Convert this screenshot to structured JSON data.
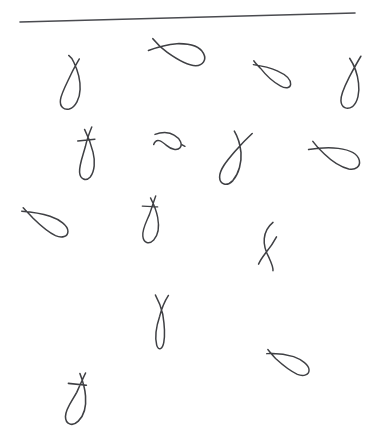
{
  "canvas": {
    "width": 375,
    "height": 428,
    "background_color": "#ffffff",
    "ink_color": "#3f4044",
    "title": "Handwritten loop strokes"
  },
  "rule": {
    "name": "horizontal-rule",
    "x1": 20,
    "y1": 22,
    "x2": 355,
    "y2": 13,
    "stroke_width": 1.6,
    "color": "#4a4b50"
  },
  "strokes": [
    {
      "id": 1,
      "label": "vertical-loop-hooked-top",
      "center_x": 72,
      "center_y": 83,
      "rotation": 8,
      "scale": 1.0,
      "stroke_width": 1.5,
      "variant": "loop-tall",
      "path": "M 14 2 C 12 7 10 12 8 18 C 5 28 1 38 1 45 C 1 52 6 55 11 53 C 17 50 20 41 19 32 C 18 22 13 12 9 6 C 7 3 5 1 3 0"
    },
    {
      "id": 2,
      "label": "diagonal-loop-crossed-tail",
      "center_x": 176,
      "center_y": 52,
      "rotation": -28,
      "scale": 1.05,
      "stroke_width": 1.5,
      "variant": "loop-slanted",
      "path": "M 0 8 C 8 9 18 11 27 15 C 37 20 45 27 45 35 C 45 42 39 45 33 42 C 26 38 20 28 15 18 C 12 12 10 5 9 0"
    },
    {
      "id": 3,
      "label": "flat-loop-crossed-tail",
      "center_x": 272,
      "center_y": 74,
      "rotation": -8,
      "scale": 0.95,
      "stroke_width": 1.5,
      "variant": "loop-flat",
      "path": "M 0 4 C 7 6 16 9 24 14 C 32 19 37 25 36 30 C 35 34 30 34 25 30 C 18 25 11 16 7 9 C 4 5 2 2 1 0"
    },
    {
      "id": 4,
      "label": "vertical-loop-rising-tail",
      "center_x": 351,
      "center_y": 82,
      "rotation": 5,
      "scale": 1.0,
      "stroke_width": 1.5,
      "variant": "loop-tall",
      "path": "M 17 0 C 14 6 11 13 8 20 C 4 30 0 39 1 46 C 2 53 8 55 13 51 C 18 46 19 36 17 27 C 15 17 10 8 6 3"
    },
    {
      "id": 5,
      "label": "vertical-loop-cross-bar",
      "center_x": 86,
      "center_y": 153,
      "rotation": 4,
      "scale": 1.0,
      "stroke_width": 1.5,
      "variant": "loop-tall-crossed",
      "path": "M 13 1 C 11 7 9 14 8 21 C 6 31 3 40 4 47 C 5 54 11 56 15 51 C 19 45 19 35 16 26 C 13 17 9 9 6 4 M 0 16 L 17 13"
    },
    {
      "id": 6,
      "label": "horizontal-flat-loop",
      "center_x": 169,
      "center_y": 141,
      "rotation": -4,
      "scale": 1.0,
      "stroke_width": 1.5,
      "variant": "loop-lazy",
      "path": "M 2 2 C 8 0 16 0 21 4 C 27 8 29 14 26 17 C 23 20 17 18 13 14 C 8 9 3 5 0 12 M 28 14 L 31 16"
    },
    {
      "id": 7,
      "label": "slanted-loop-crossed-tail",
      "center_x": 235,
      "center_y": 158,
      "rotation": 14,
      "scale": 1.05,
      "stroke_width": 1.5,
      "variant": "loop-tall",
      "path": "M 22 0 C 18 6 14 13 10 21 C 5 31 0 41 2 48 C 4 55 11 55 15 48 C 19 40 19 29 16 20 C 13 12 9 6 5 2"
    },
    {
      "id": 8,
      "label": "diagonal-loop-crossed-tail-2",
      "center_x": 334,
      "center_y": 155,
      "rotation": -22,
      "scale": 1.0,
      "stroke_width": 1.5,
      "variant": "loop-slanted",
      "path": "M 0 6 C 9 8 19 11 28 16 C 37 21 44 28 43 35 C 42 41 36 43 30 39 C 23 34 17 25 13 16 C 10 10 8 4 7 0"
    },
    {
      "id": 9,
      "label": "low-flat-loop-crossed",
      "center_x": 45,
      "center_y": 222,
      "rotation": -10,
      "scale": 1.0,
      "stroke_width": 1.5,
      "variant": "loop-flat",
      "path": "M 0 3 C 8 5 18 8 27 13 C 36 18 43 25 42 31 C 41 36 35 37 29 33 C 22 28 15 19 10 12 C 7 7 4 3 2 0"
    },
    {
      "id": 10,
      "label": "vertical-loop-cross-bar-2",
      "center_x": 150,
      "center_y": 219,
      "rotation": 10,
      "scale": 0.95,
      "stroke_width": 1.5,
      "variant": "loop-tall-crossed",
      "path": "M 12 0 C 11 6 10 13 9 20 C 7 29 4 37 6 44 C 8 51 14 52 18 46 C 22 40 21 30 18 22 C 15 14 10 7 7 3 M 0 13 L 16 11"
    },
    {
      "id": 11,
      "label": "narrow-loop-crossed-tail",
      "center_x": 268,
      "center_y": 246,
      "rotation": 6,
      "scale": 1.0,
      "stroke_width": 1.5,
      "variant": "loop-narrow",
      "path": "M 10 0 C 6 4 3 10 3 17 C 3 24 6 30 10 36 C 13 41 15 45 15 48 M 15 14 C 13 19 10 25 6 31 C 3 36 1 40 0 43"
    },
    {
      "id": 12,
      "label": "tall-narrow-loop-crossed-top",
      "center_x": 161,
      "center_y": 322,
      "rotation": 2,
      "scale": 1.0,
      "stroke_width": 1.5,
      "variant": "loop-narrow-tall",
      "path": "M 0 0 C 3 5 6 11 8 19 C 10 29 11 40 10 47 C 9 54 5 56 3 50 C 1 43 2 31 5 21 C 7 12 10 5 13 0"
    },
    {
      "id": 13,
      "label": "flat-loop-crossed-tail-3",
      "center_x": 288,
      "center_y": 362,
      "rotation": -12,
      "scale": 0.95,
      "stroke_width": 1.5,
      "variant": "loop-flat",
      "path": "M 0 4 C 8 5 18 8 27 13 C 35 18 41 25 40 30 C 39 35 33 36 27 32 C 20 27 13 18 8 11 C 5 6 3 2 2 0"
    },
    {
      "id": 14,
      "label": "bottom-loop-cross-bar",
      "center_x": 76,
      "center_y": 398,
      "rotation": 16,
      "scale": 1.05,
      "stroke_width": 1.5,
      "variant": "loop-tall-crossed",
      "path": "M 13 0 C 12 6 11 13 10 20 C 8 29 4 38 6 45 C 8 52 15 53 19 46 C 23 39 22 29 19 21 C 16 13 11 6 8 2 M 0 14 L 17 11"
    }
  ],
  "stroke_count": 14
}
